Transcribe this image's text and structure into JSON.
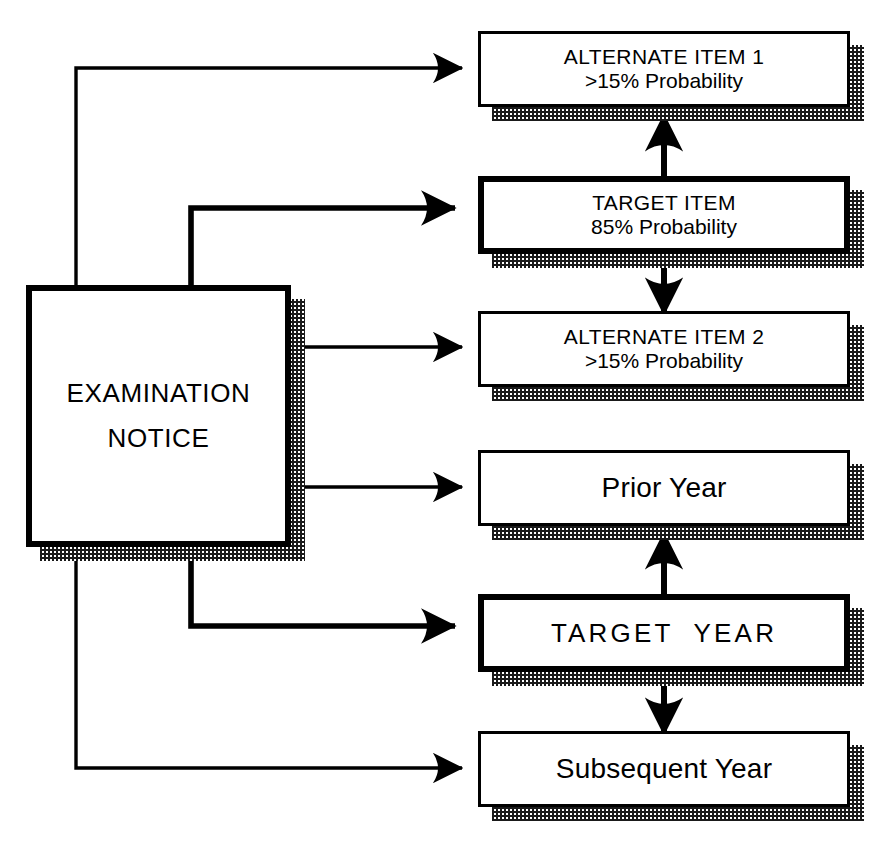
{
  "diagram": {
    "colors": {
      "ink": "#000000",
      "paper": "#ffffff",
      "fill_halftone": "#4a4a4a",
      "shadow_halftone": "#1a1a1a"
    },
    "nodes": [
      {
        "id": "examination-notice",
        "lines": [
          "EXAMINATION",
          "NOTICE"
        ],
        "style": "target",
        "emphasis": "primary"
      },
      {
        "id": "alternate-item-1",
        "lines": [
          "ALTERNATE ITEM 1",
          ">15% Probability"
        ],
        "style": "plain",
        "emphasis": "alternate"
      },
      {
        "id": "target-item",
        "lines": [
          "TARGET ITEM",
          "85% Probability"
        ],
        "style": "target",
        "emphasis": "primary"
      },
      {
        "id": "alternate-item-2",
        "lines": [
          "ALTERNATE ITEM 2",
          ">15% Probability"
        ],
        "style": "plain",
        "emphasis": "alternate"
      },
      {
        "id": "prior-year",
        "lines": [
          "Prior Year"
        ],
        "style": "plain",
        "emphasis": "alternate"
      },
      {
        "id": "target-year",
        "lines": [
          "TARGET  YEAR"
        ],
        "style": "target",
        "emphasis": "primary"
      },
      {
        "id": "subsequent-year",
        "lines": [
          "Subsequent Year"
        ],
        "style": "plain",
        "emphasis": "alternate"
      }
    ],
    "edges": [
      {
        "id": "notice-to-alternate-item-1",
        "from": "examination-notice",
        "to": "alternate-item-1",
        "weight": "thin"
      },
      {
        "id": "notice-to-target-item",
        "from": "examination-notice",
        "to": "target-item",
        "weight": "thick"
      },
      {
        "id": "notice-to-alternate-item-2",
        "from": "examination-notice",
        "to": "alternate-item-2",
        "weight": "thin"
      },
      {
        "id": "notice-to-prior-year",
        "from": "examination-notice",
        "to": "prior-year",
        "weight": "thin"
      },
      {
        "id": "notice-to-target-year",
        "from": "examination-notice",
        "to": "target-year",
        "weight": "thick"
      },
      {
        "id": "notice-to-subsequent-year",
        "from": "examination-notice",
        "to": "subsequent-year",
        "weight": "thin"
      },
      {
        "id": "target-item-to-alternate-item-1",
        "from": "target-item",
        "to": "alternate-item-1",
        "weight": "thick"
      },
      {
        "id": "target-item-to-alternate-item-2",
        "from": "target-item",
        "to": "alternate-item-2",
        "weight": "thick"
      },
      {
        "id": "target-year-to-prior-year",
        "from": "target-year",
        "to": "prior-year",
        "weight": "thick"
      },
      {
        "id": "target-year-to-subsequent-year",
        "from": "target-year",
        "to": "subsequent-year",
        "weight": "thick"
      }
    ]
  }
}
